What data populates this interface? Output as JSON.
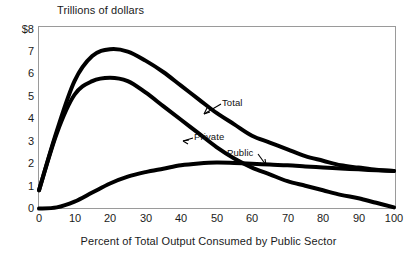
{
  "chart_data": {
    "type": "line",
    "title": "Trillions of dollars",
    "xlabel": "Percent of Total Output Consumed by Public Sector",
    "ylabel": "Trillions of dollars",
    "xlim": [
      0,
      100
    ],
    "ylim": [
      0,
      8
    ],
    "grid": false,
    "legend_position": "inline-annotations",
    "xticks": [
      "0",
      "10",
      "20",
      "30",
      "40",
      "50",
      "60",
      "70",
      "80",
      "90",
      "100"
    ],
    "yticks": [
      "$8",
      "7",
      "6",
      "5",
      "4",
      "3",
      "2",
      "1",
      "0"
    ],
    "x": [
      0,
      5,
      10,
      15,
      20,
      25,
      30,
      35,
      40,
      45,
      50,
      55,
      60,
      65,
      70,
      75,
      80,
      85,
      90,
      95,
      100
    ],
    "series": [
      {
        "name": "Total",
        "label": "Total",
        "values": [
          0.8,
          3.4,
          5.6,
          6.7,
          7.0,
          6.9,
          6.5,
          6.0,
          5.4,
          4.8,
          4.2,
          3.7,
          3.2,
          2.9,
          2.6,
          2.3,
          2.1,
          1.9,
          1.8,
          1.7,
          1.65
        ]
      },
      {
        "name": "Private",
        "label": "Private",
        "values": [
          0.8,
          3.3,
          5.0,
          5.6,
          5.75,
          5.6,
          5.1,
          4.5,
          3.9,
          3.3,
          2.7,
          2.2,
          1.8,
          1.5,
          1.2,
          1.0,
          0.8,
          0.6,
          0.45,
          0.25,
          0.05
        ]
      },
      {
        "name": "Public",
        "label": "Public",
        "values": [
          0.0,
          0.05,
          0.3,
          0.7,
          1.1,
          1.4,
          1.6,
          1.75,
          1.9,
          1.98,
          2.02,
          2.0,
          1.97,
          1.93,
          1.9,
          1.85,
          1.8,
          1.76,
          1.72,
          1.68,
          1.65
        ]
      }
    ],
    "annotations": [
      {
        "text": "Total",
        "x_pct": 53,
        "y_value": 5.2
      },
      {
        "text": "Private",
        "x_pct": 44,
        "y_value": 3.4
      },
      {
        "text": "Public",
        "x_pct": 54,
        "y_value": 2.55
      }
    ]
  },
  "colors": {
    "line": "#000000",
    "frame": "#8c8c8c",
    "text": "#1a1a1a",
    "background": "#ffffff"
  }
}
